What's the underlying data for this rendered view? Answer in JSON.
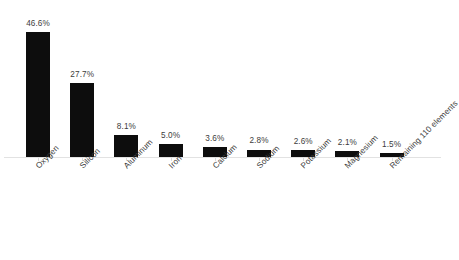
{
  "chart": {
    "background_color": "#ffffff",
    "bar_color": "#0d0d0d",
    "label_color": "#3c3c3c",
    "axis_color": "#e2e2e2"
  },
  "chart_data": {
    "type": "bar",
    "title": "",
    "subtitle": "",
    "xlabel": "",
    "ylabel": "",
    "ylim": [
      0,
      50
    ],
    "grid": false,
    "legend": "none",
    "orientation": "vertical",
    "value_label_position": "outside-end",
    "category_label_rotation": -45,
    "categories": [
      "Oxygen",
      "Silicon",
      "Aluminum",
      "Iron",
      "Calcium",
      "Sodium",
      "Potassium",
      "Magnesium",
      "Remaining 110 elements"
    ],
    "values": [
      46.6,
      27.7,
      8.1,
      5.0,
      3.6,
      2.8,
      2.6,
      2.1,
      1.5
    ],
    "value_labels": [
      "46.6%",
      "27.7%",
      "8.1%",
      "5.0%",
      "3.6%",
      "2.8%",
      "2.6%",
      "2.1%",
      "1.5%"
    ],
    "units": "percent"
  }
}
